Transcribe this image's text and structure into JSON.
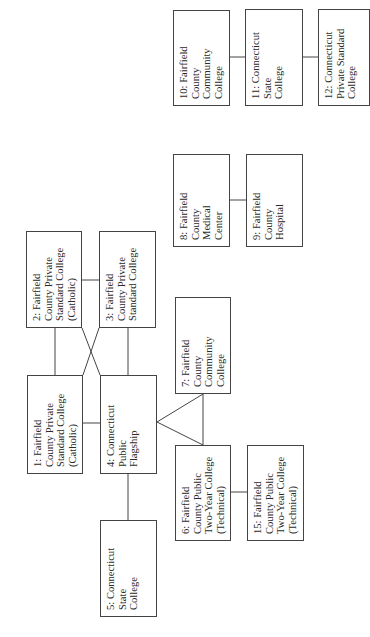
{
  "diagram": {
    "orientation": "rotated-90-ccw",
    "nodes": [
      {
        "id": "1",
        "label": "1: Fairfield\nCounty Private\nStandard College\n(Catholic)",
        "box": [
          27,
          375,
          56,
          99
        ]
      },
      {
        "id": "2",
        "label": "2: Fairfield\nCounty Private\nStandard College\n(Catholic)",
        "box": [
          26,
          231,
          56,
          97
        ]
      },
      {
        "id": "3",
        "label": "3: Fairfield\nCounty Private\nStandard College",
        "box": [
          99,
          231,
          57,
          97
        ]
      },
      {
        "id": "4",
        "label": "4: Connecticut\nPublic\nFlagship",
        "box": [
          100,
          375,
          57,
          99
        ]
      },
      {
        "id": "5",
        "label": "5: Connecticut\nState\nCollege",
        "box": [
          100,
          520,
          57,
          97
        ]
      },
      {
        "id": "6",
        "label": "6: Fairfield\nCounty Public\nTwo-Year College\n(Technical)",
        "box": [
          175,
          445,
          56,
          96
        ]
      },
      {
        "id": "7",
        "label": "7: Fairfield\nCounty\nCommunity\nCollege",
        "box": [
          175,
          297,
          56,
          97
        ]
      },
      {
        "id": "8",
        "label": "8: Fairfield\nCounty\nMedical\nCenter",
        "box": [
          173,
          154,
          57,
          93
        ]
      },
      {
        "id": "9",
        "label": "9: Fairfield\nCounty\nHospital",
        "box": [
          246,
          154,
          57,
          93
        ]
      },
      {
        "id": "10",
        "label": "10: Fairfield\nCounty\nCommunity\nCollege",
        "box": [
          173,
          10,
          57,
          96
        ]
      },
      {
        "id": "11",
        "label": "11: Connecticut\nState\nCollege",
        "box": [
          245,
          9,
          58,
          97
        ]
      },
      {
        "id": "12",
        "label": "12: Connecticut\nPrivate Standard\nCollege",
        "box": [
          318,
          9,
          52,
          97
        ]
      },
      {
        "id": "15",
        "label": "15: Fairfield\nCounty Public\nTwo-Year College\n(Technical)",
        "box": [
          247,
          445,
          57,
          96
        ]
      }
    ],
    "edges": [
      {
        "from": "2",
        "to": "3"
      },
      {
        "from": "2",
        "to": "1"
      },
      {
        "from": "3",
        "to": "4"
      },
      {
        "from": "2",
        "to": "4"
      },
      {
        "from": "3",
        "to": "1"
      },
      {
        "from": "1",
        "to": "4"
      },
      {
        "from": "4",
        "to": "5"
      },
      {
        "from": "4",
        "to": "7"
      },
      {
        "from": "4",
        "to": "6"
      },
      {
        "from": "7",
        "to": "6"
      },
      {
        "from": "6",
        "to": "15"
      },
      {
        "from": "8",
        "to": "9"
      },
      {
        "from": "10",
        "to": "11"
      },
      {
        "from": "11",
        "to": "12"
      }
    ],
    "line_color": "#444444",
    "box_border_color": "#444444",
    "text_color": "#2a2a2a"
  }
}
